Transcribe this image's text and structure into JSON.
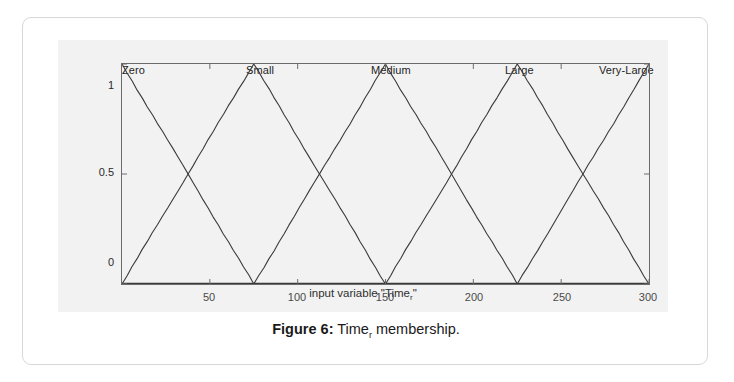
{
  "figure": {
    "caption_label": "Figure 6:",
    "caption_text_pre": " Time",
    "caption_sub": "r",
    "caption_text_post": " membership."
  },
  "chart_data": {
    "type": "line",
    "title": "",
    "xlabel_pre": "input variable \"Time",
    "xlabel_sub": "r",
    "xlabel_post": "\"",
    "xlabel": "input variable \"Time_r\"",
    "ylabel": "",
    "xlim": [
      0,
      300
    ],
    "ylim": [
      0,
      1
    ],
    "xticks": [
      50,
      100,
      150,
      200,
      250,
      300
    ],
    "xtick_labels": [
      "50",
      "100",
      "150",
      "200",
      "250",
      "300"
    ],
    "yticks": [
      0,
      0.5,
      1
    ],
    "ytick_labels": [
      "0",
      "0.5",
      "1"
    ],
    "grid": false,
    "legend_position": "above-plot-inline",
    "line_color": "#3a3a3a",
    "series": [
      {
        "name": "Zero",
        "label_x": 8,
        "points": [
          [
            0,
            1
          ],
          [
            75,
            0
          ],
          [
            300,
            0
          ]
        ]
      },
      {
        "name": "Small",
        "label_x": 75,
        "points": [
          [
            0,
            0
          ],
          [
            75,
            1
          ],
          [
            150,
            0
          ],
          [
            300,
            0
          ]
        ]
      },
      {
        "name": "Medium",
        "label_x": 150,
        "points": [
          [
            0,
            0
          ],
          [
            75,
            0
          ],
          [
            150,
            1
          ],
          [
            225,
            0
          ],
          [
            300,
            0
          ]
        ]
      },
      {
        "name": "Large",
        "label_x": 225,
        "points": [
          [
            0,
            0
          ],
          [
            150,
            0
          ],
          [
            225,
            1
          ],
          [
            300,
            0
          ]
        ]
      },
      {
        "name": "Very-Large",
        "label_x": 292,
        "points": [
          [
            0,
            0
          ],
          [
            225,
            0
          ],
          [
            300,
            1
          ]
        ]
      }
    ]
  }
}
